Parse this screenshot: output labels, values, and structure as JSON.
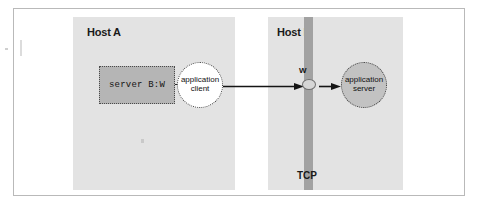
{
  "figure": {
    "hosts": [
      {
        "id": "host-a",
        "label": "Host A"
      },
      {
        "id": "host-b",
        "label": "Host B"
      }
    ],
    "host_a": {
      "label": "Host A",
      "server_box": {
        "label": "server B:W",
        "fill": "#b5b5b5",
        "border_style": "dotted"
      },
      "client_node": {
        "line1": "application",
        "line2": "client",
        "fill": "#ffffff",
        "border_style": "dotted"
      }
    },
    "host_b": {
      "label": "Host B",
      "tcp_bar": {
        "label": "TCP",
        "color": "#a2a2a2"
      },
      "port_node": {
        "label": "W",
        "fill": "#d6d6d6"
      },
      "server_node": {
        "line1": "application",
        "line2": "server",
        "fill": "#c2c2c2",
        "border_style": "dotted"
      }
    },
    "arrows": [
      {
        "id": "client-to-w",
        "from": "application client",
        "to": "W",
        "direction": "right"
      },
      {
        "id": "w-to-server",
        "from": "W",
        "to": "application server",
        "direction": "right"
      }
    ],
    "colors": {
      "panel": "#e3e3e3",
      "tcp_bar": "#a2a2a2",
      "server_box": "#b5b5b5",
      "server_circle": "#c2c2c2",
      "client_circle": "#ffffff",
      "frame_border": "#b9b9b9",
      "ink": "#111111",
      "page": "#ffffff"
    }
  }
}
